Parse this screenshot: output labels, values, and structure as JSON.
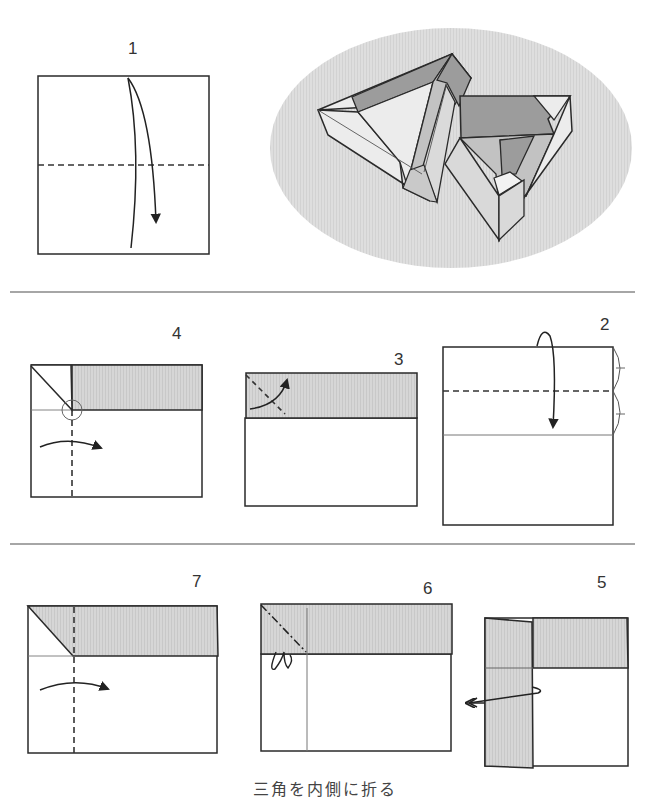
{
  "colors": {
    "line": "#2a2a2a",
    "thin_line": "#777777",
    "flap_gray": "#d4d4d4",
    "ellipse_gray": "#dcdcdc",
    "dark_face": "#9c9c9c",
    "mid_face": "#c2c2c2",
    "light_face": "#ececec",
    "separator": "#888888"
  },
  "steps": [
    {
      "number": "1",
      "description": "Fold square in half downward along the dashed valley line"
    },
    {
      "number": "2",
      "description": "Fold top edge down to the midline (halve the upper section)"
    },
    {
      "number": "3",
      "description": "Fold top-left corner of the flap along the diagonal"
    },
    {
      "number": "4",
      "description": "Valley fold the left edge to the right along the vertical dashed line"
    },
    {
      "number": "5",
      "description": "Unfold the left strip back outward"
    },
    {
      "number": "6",
      "description": "Mountain fold the corner triangle inside"
    },
    {
      "number": "7",
      "description": "Valley fold along the vertical dashed line to the right"
    }
  ],
  "result_illustration": {
    "label": "Finished model: two interlocking triangular boxes"
  },
  "caption": "三角を内側に折る"
}
